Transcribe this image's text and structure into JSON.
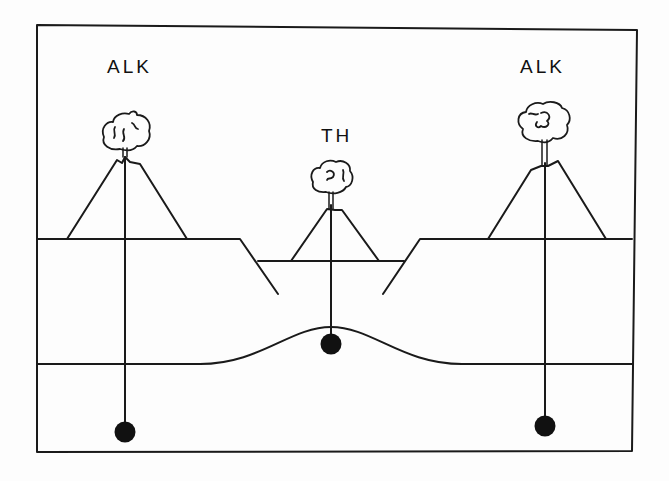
{
  "diagram": {
    "labels": {
      "left_volcano": "ALK",
      "center_volcano": "TH",
      "right_volcano": "ALK"
    },
    "colors": {
      "line": "#1a1a1a",
      "background": "#fdfdfd"
    }
  }
}
